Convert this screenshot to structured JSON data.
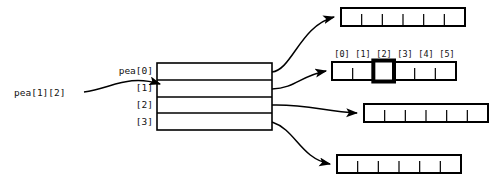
{
  "diagram": {
    "colors": {
      "stroke": "#000000",
      "background": "#ffffff",
      "text": "#111111",
      "highlight": "#000000"
    },
    "pointer_box": {
      "name": "pea-pointer-box",
      "x": 157,
      "y": 63,
      "width": 115,
      "height": 67,
      "rows": [
        {
          "label": "pea[0]",
          "index": 0
        },
        {
          "label": "[1]",
          "index": 1
        },
        {
          "label": "[2]",
          "index": 2
        },
        {
          "label": "[3]",
          "index": 3
        }
      ]
    },
    "element_label": {
      "name": "pea-element-label",
      "text": "pea[1][2]",
      "x": 14,
      "y": 96
    },
    "index_header": {
      "cells": [
        "[0]",
        "[1]",
        "[2]",
        "[3]",
        "[4]",
        "[5]"
      ],
      "y": 53
    },
    "arrays": [
      {
        "name": "row-array-0",
        "x": 341,
        "y": 8,
        "width": 124,
        "height": 18,
        "cells": 6,
        "highlight_cell": null
      },
      {
        "name": "row-array-1",
        "x": 332,
        "y": 62,
        "width": 124,
        "height": 18,
        "cells": 6,
        "highlight_cell": 2
      },
      {
        "name": "row-array-2",
        "x": 364,
        "y": 104,
        "width": 124,
        "height": 18,
        "cells": 6,
        "highlight_cell": null
      },
      {
        "name": "row-array-3",
        "x": 337,
        "y": 155,
        "width": 124,
        "height": 18,
        "cells": 6,
        "highlight_cell": null
      }
    ]
  }
}
